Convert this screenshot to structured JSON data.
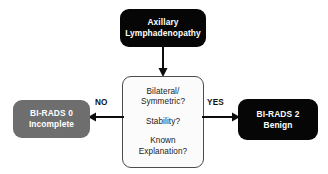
{
  "diagram": {
    "colors": {
      "black_node": "#060606",
      "gray_node": "#6e6e6e",
      "white_node": "#fbfbfb",
      "node_border": "#4c4c4c",
      "text_light": "#ffffff",
      "text_dark": "#1a1a1a",
      "background": "#ffffff"
    },
    "nodes": {
      "start": {
        "id": "axillary-lymphadenopathy",
        "shape": "rounded-rect",
        "fill": "black",
        "line1": "Axillary",
        "line2": "Lymphadenopathy"
      },
      "decision": {
        "id": "decision-criteria",
        "shape": "rounded-rect",
        "fill": "white",
        "line1": "Bilateral/",
        "line2": "Symmetric?",
        "line3": "Stability?",
        "line4": "Known",
        "line5": "Explanation?"
      },
      "outcome_no": {
        "id": "bi-rads-0",
        "shape": "rounded-rect",
        "fill": "gray",
        "line1": "BI-RADS 0",
        "line2": "Incomplete"
      },
      "outcome_yes": {
        "id": "bi-rads-2",
        "shape": "rounded-rect",
        "fill": "black",
        "line1": "BI-RADS 2",
        "line2": "Benign"
      }
    },
    "edges": {
      "start_to_decision": {
        "label": "",
        "direction": "down"
      },
      "decision_to_no": {
        "label": "NO",
        "direction": "left"
      },
      "decision_to_yes": {
        "label": "YES",
        "direction": "right"
      }
    }
  }
}
